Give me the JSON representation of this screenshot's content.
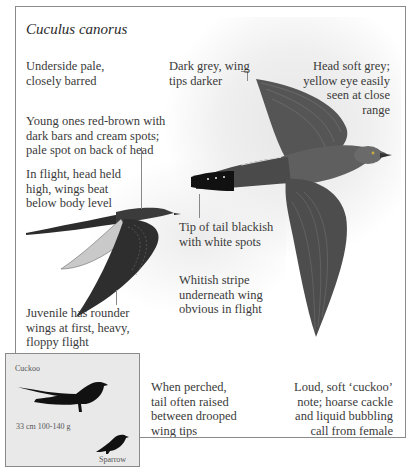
{
  "title": "Cuculus canorus",
  "labels": {
    "underside": [
      "Underside pale,",
      "closely barred"
    ],
    "dark_grey": [
      "Dark grey, wing",
      "tips darker"
    ],
    "head": [
      "Head soft grey;",
      "yellow eye easily",
      "seen at close",
      "range"
    ],
    "young": [
      "Young ones red-brown with",
      "dark bars and cream spots;",
      "pale spot on back of head"
    ],
    "in_flight": [
      "In flight, head held",
      "high, wings beat",
      "below body level"
    ],
    "tail_tip": [
      "Tip of tail blackish",
      "with white spots"
    ],
    "whitish": [
      "Whitish stripe",
      "underneath wing",
      "obvious in flight"
    ],
    "juvenile": [
      "Juvenile has rounder",
      "wings at first, heavy,",
      "floppy flight"
    ],
    "perched": [
      "When perched,",
      "tail often raised",
      "between drooped",
      "wing tips"
    ],
    "call": [
      "Loud, soft ‘cuckoo’",
      "note; hoarse cackle",
      "and liquid bubbling",
      "call from female"
    ]
  },
  "inset": {
    "bird_name": "Cuckoo",
    "measurements": "33 cm 100-140 g",
    "comparison": "Sparrow"
  },
  "colors": {
    "text": "#3a3a3a",
    "border": "#8a8a8a",
    "inset_bg": "#e9e9e9",
    "bird_dark": "#2a2a2a",
    "bird_grey": "#5a5a5a"
  }
}
